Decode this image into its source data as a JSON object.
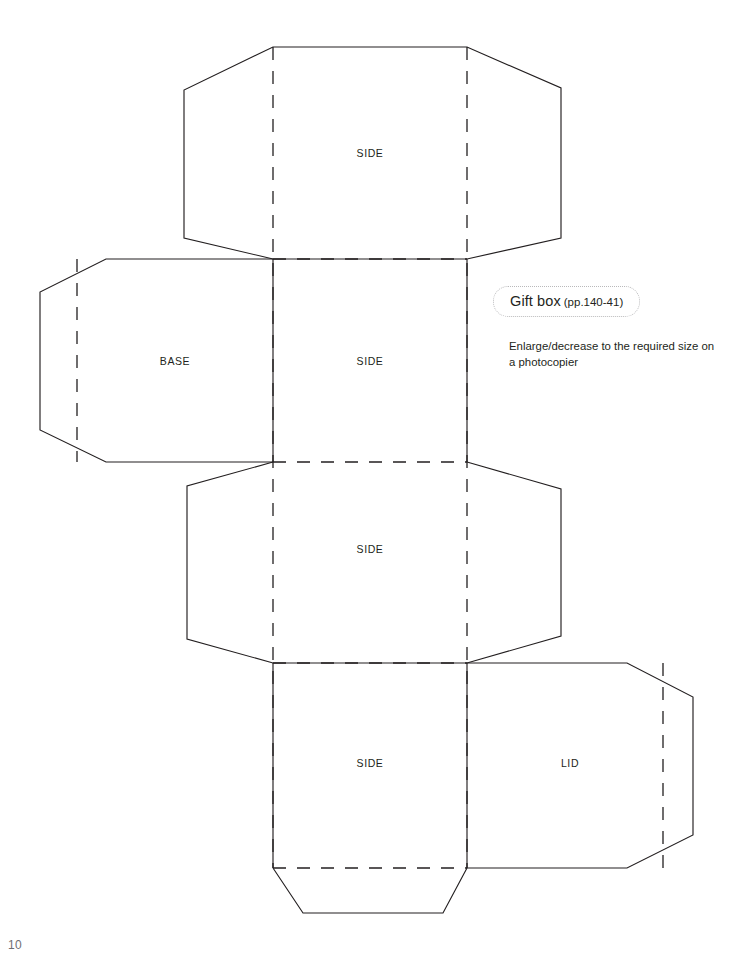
{
  "page": {
    "folio": "10",
    "background_color": "#ffffff",
    "ink_color": "#231f20",
    "width": 755,
    "height": 953
  },
  "annotation": {
    "caption_title": "Gift box",
    "caption_pages": "(pp.140-41)",
    "caption_border_color": "#b9b9bb",
    "caption_border_style": "dotted",
    "instruction": "Enlarge/decrease to the required size on a photocopier"
  },
  "diagram": {
    "type": "papercraft-die-cut-template",
    "line_styles": {
      "cut": {
        "stroke": "#231f20",
        "dash": "solid",
        "width": 1.15
      },
      "fold": {
        "stroke": "#231f20",
        "dash": "13 11",
        "width": 1.3
      }
    },
    "panel_labels": [
      {
        "name": "side-top",
        "text": "SIDE",
        "x": 370,
        "y": 154
      },
      {
        "name": "base",
        "text": "BASE",
        "x": 175,
        "y": 362
      },
      {
        "name": "side-upper-middle",
        "text": "SIDE",
        "x": 370,
        "y": 362
      },
      {
        "name": "side-lower-middle",
        "text": "SIDE",
        "x": 370,
        "y": 550
      },
      {
        "name": "side-bottom",
        "text": "SIDE",
        "x": 370,
        "y": 764
      },
      {
        "name": "lid",
        "text": "LID",
        "x": 570,
        "y": 764
      }
    ],
    "cut_paths": [
      {
        "name": "side-top-outline",
        "d": "M 273 47 L 467 47 L 561 88 L 561 238 L 467 259 L 273 259 L 184 238 L 184 90 Z"
      },
      {
        "name": "base-outline",
        "d": "M 273 259 L 106 259 L 40 292 L 40 430 L 106 462 L 273 462"
      },
      {
        "name": "side-lower-middle-outline",
        "d": "M 273 462 L 187 486 L 187 639 L 273 663 L 467 663 L 561 636 L 561 489 L 467 462"
      },
      {
        "name": "lid-outline",
        "d": "M 467 663 L 627 663 L 693 697 L 693 835 L 627 868 L 467 868"
      },
      {
        "name": "bottom-flap-outline",
        "d": "M 273 868 L 303 913 L 443 913 L 467 868"
      },
      {
        "name": "left-spine",
        "d": "M 273 259 L 273 462"
      },
      {
        "name": "right-spine",
        "d": "M 467 259 L 467 462"
      },
      {
        "name": "left-spine-lower",
        "d": "M 273 663 L 273 868"
      },
      {
        "name": "right-spine-lower",
        "d": "M 467 663 L 467 868"
      }
    ],
    "fold_paths": [
      {
        "name": "fold-vertical-left",
        "d": "M 273 47 L 273 868"
      },
      {
        "name": "fold-vertical-right",
        "d": "M 467 47 L 467 868"
      },
      {
        "name": "fold-horizontal-1",
        "d": "M 273 259 L 467 259"
      },
      {
        "name": "fold-horizontal-2",
        "d": "M 273 462 L 467 462"
      },
      {
        "name": "fold-horizontal-3",
        "d": "M 273 663 L 467 663"
      },
      {
        "name": "fold-horizontal-4",
        "d": "M 273 868 L 467 868"
      },
      {
        "name": "fold-base-flap",
        "d": "M 77 259 L 77 462"
      },
      {
        "name": "fold-lid-flap",
        "d": "M 663 663 L 663 868"
      }
    ]
  }
}
